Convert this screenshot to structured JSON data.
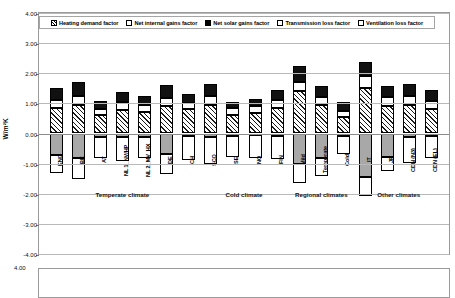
{
  "chart_data": {
    "type": "bar",
    "subtype": "stacked-bar-positive-negative",
    "title": "",
    "xlabel": "",
    "ylabel": "W/m²K",
    "ylim": [
      -4.0,
      4.0
    ],
    "ytick_labels": [
      "4.00",
      "3.00",
      "2.00",
      "1.00",
      "0.00",
      "-1.00",
      "-2.00",
      "-3.00",
      "-4.00"
    ],
    "ytick_values": [
      4,
      3,
      2,
      1,
      0,
      -1,
      -2,
      -3,
      -4
    ],
    "grid": true,
    "legend_position": "top-inside",
    "legend": [
      {
        "label": "Heating demand factor",
        "pattern": "hatch"
      },
      {
        "label": "Net internal gains factor",
        "pattern": "white"
      },
      {
        "label": "Net solar gains factor",
        "pattern": "black"
      },
      {
        "label": "Transmission loss factor",
        "pattern": "dot"
      },
      {
        "label": "Ventilation loss factor",
        "pattern": "white"
      }
    ],
    "categories": [
      "ENG",
      "BE",
      "AT",
      "NL 1_NV/HP",
      "NL 2_MV_HX",
      "DE",
      "CH",
      "SCO",
      "SE",
      "NO",
      "FIN",
      "Mild",
      "Temperate",
      "Cold",
      "IT",
      "JP",
      "CDN (N3)",
      "CDN (EL)"
    ],
    "groups": [
      {
        "label": "Temperate climate",
        "from": 0,
        "to": 6
      },
      {
        "label": "Cold climate",
        "from": 7,
        "to": 10
      },
      {
        "label": "Regional climates",
        "from": 11,
        "to": 13
      },
      {
        "label": "Other climates",
        "from": 14,
        "to": 17
      }
    ],
    "series": [
      {
        "name": "Heating demand factor",
        "pattern": "hatch",
        "values": [
          0.85,
          0.95,
          0.6,
          0.78,
          0.72,
          0.92,
          0.8,
          0.95,
          0.62,
          0.68,
          0.85,
          1.4,
          0.95,
          0.55,
          1.52,
          0.9,
          0.95,
          0.82
        ]
      },
      {
        "name": "Net internal gains factor",
        "pattern": "white",
        "values": [
          0.25,
          0.28,
          0.2,
          0.26,
          0.22,
          0.26,
          0.22,
          0.3,
          0.22,
          0.24,
          0.25,
          0.32,
          0.26,
          0.2,
          0.4,
          0.3,
          0.3,
          0.26
        ]
      },
      {
        "name": "Net solar gains factor",
        "pattern": "black",
        "values": [
          0.42,
          0.48,
          0.28,
          0.33,
          0.3,
          0.42,
          0.3,
          0.38,
          0.22,
          0.24,
          0.35,
          0.52,
          0.38,
          0.28,
          0.45,
          0.38,
          0.4,
          0.38
        ]
      },
      {
        "name": "Transmission loss factor",
        "pattern": "grey",
        "values": [
          -0.72,
          -0.82,
          -0.1,
          -0.12,
          -0.1,
          -0.68,
          -0.08,
          -0.1,
          -0.08,
          -0.06,
          -0.08,
          -1.02,
          -0.82,
          -0.08,
          -1.45,
          -0.78,
          -0.1,
          -0.08
        ]
      },
      {
        "name": "Ventilation loss factor",
        "pattern": "white",
        "values": [
          -0.58,
          -0.7,
          -0.72,
          -0.78,
          -0.72,
          -0.68,
          -0.8,
          -0.92,
          -0.7,
          -0.74,
          -0.78,
          -0.62,
          -0.58,
          -0.6,
          -0.62,
          -0.48,
          -0.88,
          -0.72
        ]
      }
    ]
  },
  "axis": {
    "unit_label": "W/m²K"
  },
  "chart2": {
    "ytick_top": "4.00"
  }
}
